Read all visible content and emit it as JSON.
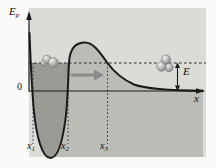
{
  "diagram": {
    "y_axis_label": {
      "main": "E",
      "sub": "p"
    },
    "x_axis_label": "x",
    "origin_label": "0",
    "energy_label": "E",
    "turning_points": [
      {
        "main": "x",
        "sub": "1"
      },
      {
        "main": "x",
        "sub": "2"
      },
      {
        "main": "x",
        "sub": "3"
      }
    ],
    "markers": {
      "x1_px": 33,
      "x2_px": 68,
      "x3_px": 107.5,
      "energy_level_y_px": 63
    },
    "colors": {
      "plot_bg": "#dbdbd7",
      "under_curve_fill": "#bbbcb6",
      "well_fill": "#9a9b95",
      "curve": "#1a1a1a",
      "axis": "#1a1a1a",
      "arrow": "#8a8a88"
    }
  }
}
